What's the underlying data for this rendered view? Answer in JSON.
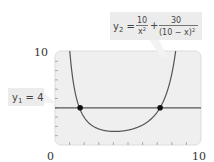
{
  "chart_data": {
    "type": "line",
    "title": "",
    "xlabel": "",
    "ylabel": "",
    "xlim": [
      0,
      10
    ],
    "ylim": [
      0,
      10
    ],
    "x_tick_labels": [
      "0",
      "10"
    ],
    "y_tick_labels": [
      "10"
    ],
    "x_minor_ticks": 10,
    "y_minor_ticks": 10,
    "grid": false,
    "series": [
      {
        "name": "y1 = 4",
        "kind": "constant",
        "value": 4,
        "color": "#555555"
      },
      {
        "name": "y2 = 10/x^2 + 30/(10 - x)^2",
        "kind": "function",
        "expression": "10/x^2 + 30/(10-x)^2",
        "color": "#555555",
        "sample_points": [
          {
            "x": 1.2,
            "y": 10.0
          },
          {
            "x": 1.72,
            "y": 4.0
          },
          {
            "x": 2.5,
            "y": 2.13
          },
          {
            "x": 4.1,
            "y": 1.46
          },
          {
            "x": 5.5,
            "y": 1.81
          },
          {
            "x": 7.2,
            "y": 4.0
          },
          {
            "x": 8.1,
            "y": 10.0
          }
        ]
      }
    ],
    "intersections": [
      {
        "x": 1.72,
        "y": 4
      },
      {
        "x": 7.2,
        "y": 4
      }
    ],
    "annotations": [
      {
        "label": "y1 = 4",
        "target": "y1"
      },
      {
        "label": "y2 = 10/x² + 30/(10 − x)²",
        "target": "y2"
      }
    ]
  },
  "labels": {
    "y1_name": "y",
    "y1_sub": "1",
    "y1_rest": " = 4",
    "y2_name": "y",
    "y2_sub": "2",
    "y2_eq": " = ",
    "y2_frac1_num": "10",
    "y2_frac1_den": "x",
    "y2_frac1_den_exp": "2",
    "y2_plus": "+",
    "y2_frac2_num": "30",
    "y2_frac2_den": "(10 − x)",
    "y2_frac2_den_exp": "2",
    "x_min": "0",
    "x_max": "10",
    "y_max": "10"
  },
  "colors": {
    "plot_bg": "#efefef",
    "plot_border": "#d8d8d8",
    "line": "#555555",
    "point": "#111111",
    "callout_bg": "#ececec"
  }
}
